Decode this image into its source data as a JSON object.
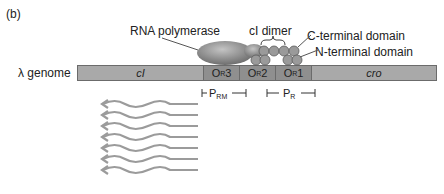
{
  "panel": {
    "label": "(b)"
  },
  "genome": {
    "label": "λ genome",
    "segments": [
      {
        "id": "cI",
        "label": "cI",
        "italic": true
      },
      {
        "id": "OR3",
        "label": "O",
        "sub": "R",
        "suffix": "3"
      },
      {
        "id": "OR2",
        "label": "O",
        "sub": "R",
        "suffix": "2"
      },
      {
        "id": "OR1",
        "label": "O",
        "sub": "R",
        "suffix": "1"
      },
      {
        "id": "cro",
        "label": "cro",
        "italic": true
      }
    ]
  },
  "labels": {
    "rna_polymerase": "RNA polymerase",
    "ci_dimer": "cI dimer",
    "c_terminal": "C-terminal domain",
    "n_terminal": "N-terminal domain"
  },
  "promoters": [
    {
      "id": "PRM",
      "label": "P",
      "sub": "RM"
    },
    {
      "id": "PR",
      "label": "P",
      "sub": "R"
    }
  ],
  "transcripts": {
    "count": 7,
    "direction": "leftward"
  },
  "colors": {
    "genome_bar": "#a9a9a9",
    "operator": "#8f8f8f",
    "polymerase": "#8a8a8a",
    "domain": "#9a9a9a",
    "transcript": "#9b9b9b"
  }
}
